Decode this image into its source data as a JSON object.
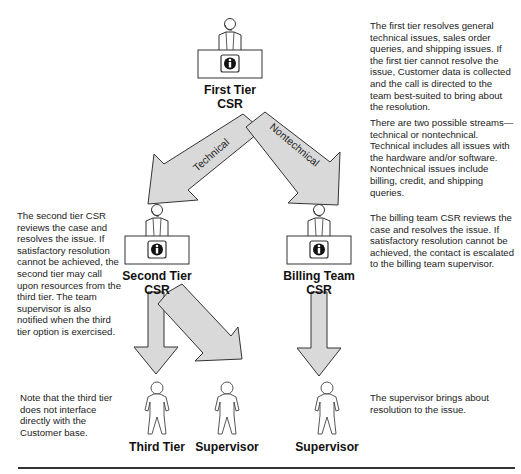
{
  "nodes": {
    "first_tier": {
      "line1": "First Tier",
      "line2": "CSR",
      "icon": "info-icon"
    },
    "second_tier": {
      "line1": "Second Tier",
      "line2": "CSR",
      "icon": "info-icon"
    },
    "billing_team": {
      "line1": "Billing Team",
      "line2": "CSR",
      "icon": "info-icon"
    },
    "third_tier": {
      "label": "Third Tier"
    },
    "supervisor_left": {
      "label": "Supervisor"
    },
    "supervisor_right": {
      "label": "Supervisor"
    }
  },
  "arrows": {
    "technical": "Technical",
    "nontechnical": "Nontechnical"
  },
  "notes": {
    "first_tier": "The first tier resolves general technical issues, sales order queries, and shipping issues. If the first tier cannot resolve the issue, Customer data is collected and the call is directed to the team best-suited to bring about the resolution.",
    "streams": "There are two possible streams—technical or nontechnical. Technical includes all issues with the hardware and/or software. Nontechnical issues include billing, credit, and shipping queries.",
    "second_tier": "The second tier CSR reviews the case and resolves the issue. If satisfactory resolution cannot be achieved, the second tier may call upon resources from the third tier. The team supervisor is also notified when the third tier option is exercised.",
    "billing_team": "The billing team CSR reviews the case and resolves the issue. If satisfactory resolution cannot be achieved, the contact is escalated to the billing team supervisor.",
    "third_tier": "Note that the third tier does not interface directly with the Customer base.",
    "supervisor": "The supervisor brings about resolution to the issue."
  },
  "colors": {
    "arrow_fill": "#d9d9d9",
    "stroke": "#333333"
  }
}
